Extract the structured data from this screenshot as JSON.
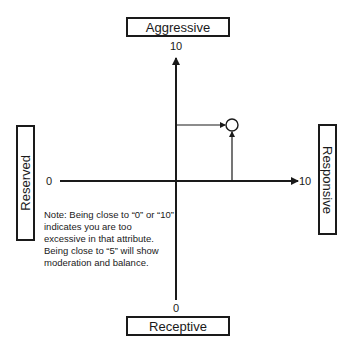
{
  "diagram": {
    "axes": {
      "top_label": "Aggressive",
      "bottom_label": "Receptive",
      "left_label": "Reserved",
      "right_label": "Responsive",
      "y_max_tick": "10",
      "y_min_tick": "0",
      "x_min_tick": "0",
      "x_max_tick": "10"
    },
    "point": {
      "x_value": 7,
      "y_value": 7.5,
      "marker": "open-circle"
    },
    "note": "Note: Being close to “0” or “10” indicates you are too excessive in that attribute. Being close to “5” will show moderation and balance.",
    "colors": {
      "line": "#1a1a1a",
      "background": "#ffffff"
    }
  }
}
